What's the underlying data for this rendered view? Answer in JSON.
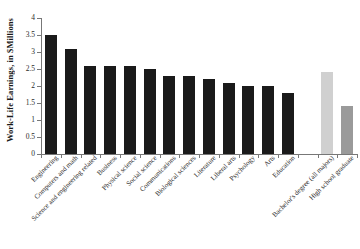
{
  "chart_data": {
    "type": "bar",
    "title": "",
    "subtitle": "",
    "xlabel": "",
    "ylabel": "Work-Life Earnings, in $Millions",
    "ylim": [
      0,
      4
    ],
    "ytick_labels": [
      "0",
      "0.5",
      "1",
      "1.5",
      "2",
      "2.5",
      "3",
      "3.5",
      "4"
    ],
    "ytick_values": [
      0,
      0.5,
      1,
      1.5,
      2,
      2.5,
      3,
      3.5,
      4
    ],
    "grid": false,
    "legend": "none",
    "categories": [
      "Engineering",
      "Computers and math",
      "Science and engineering related",
      "Business",
      "Physical science",
      "Social science",
      "Communications",
      "Biological sciences",
      "Literature",
      "Liberal arts",
      "Psychology",
      "Arts",
      "Education",
      "Bachelor's degree (all majors)",
      "High school graduate"
    ],
    "values": [
      3.5,
      3.1,
      2.6,
      2.6,
      2.6,
      2.5,
      2.3,
      2.3,
      2.2,
      2.1,
      2.0,
      2.0,
      1.8,
      2.4,
      1.4
    ],
    "bar_colors": [
      "#1a1a1a",
      "#1a1a1a",
      "#1a1a1a",
      "#1a1a1a",
      "#1a1a1a",
      "#1a1a1a",
      "#1a1a1a",
      "#1a1a1a",
      "#1a1a1a",
      "#1a1a1a",
      "#1a1a1a",
      "#1a1a1a",
      "#1a1a1a",
      "#d0d0d0",
      "#9a9a9a"
    ],
    "gap_after_index": 12,
    "axis_color": "#777777"
  }
}
